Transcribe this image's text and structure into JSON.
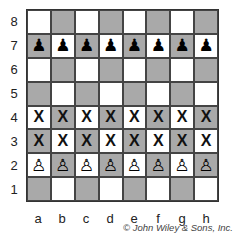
{
  "diagram": {
    "type": "chessboard",
    "colors": {
      "light": "#ffffff",
      "dark": "#a9a9a9",
      "grid": "#444444"
    },
    "ranks": [
      "8",
      "7",
      "6",
      "5",
      "4",
      "3",
      "2",
      "1"
    ],
    "files": [
      "a",
      "b",
      "c",
      "d",
      "e",
      "f",
      "g",
      "h"
    ],
    "rows": [
      [
        "",
        "",
        "",
        "",
        "",
        "",
        "",
        ""
      ],
      [
        "♟",
        "♟",
        "♟",
        "♟",
        "♟",
        "♟",
        "♟",
        "♟"
      ],
      [
        "",
        "",
        "",
        "",
        "",
        "",
        "",
        ""
      ],
      [
        "",
        "",
        "",
        "",
        "",
        "",
        "",
        ""
      ],
      [
        "X",
        "X",
        "X",
        "X",
        "X",
        "X",
        "X",
        "X"
      ],
      [
        "X",
        "X",
        "X",
        "X",
        "X",
        "X",
        "X",
        "X"
      ],
      [
        "♙",
        "♙",
        "♙",
        "♙",
        "♙",
        "♙",
        "♙",
        "♙"
      ],
      [
        "",
        "",
        "",
        "",
        "",
        "",
        "",
        ""
      ]
    ],
    "legend": {
      "black_pawn": "♟",
      "white_pawn": "♙",
      "marked_square": "X"
    },
    "credit": "© John Wiley & Sons, Inc."
  }
}
